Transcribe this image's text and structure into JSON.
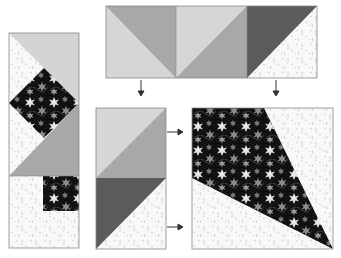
{
  "diagram": {
    "colors": {
      "light_gray": "#d4d4d4",
      "medium_gray": "#a6a6a6",
      "dark_gray": "#5b5b5b",
      "background_print": "#f7f7f7",
      "floral_base": "#111111",
      "floral_star": "#8a8a8a",
      "floral_highlight": "#e8e8e8",
      "outline": "#7a7a7a"
    },
    "panels": [
      {
        "id": "assembled-strip",
        "description": "Tall assembled unit: light and medium triangles around floral diamond, with floral square on speckled background"
      },
      {
        "id": "half-square-triangles-row",
        "description": "Three half-square triangle units: light/medium, light/medium, dark/background"
      },
      {
        "id": "hst-stack",
        "description": "Two stacked half-square triangle units: light/medium over dark/background"
      },
      {
        "id": "floral-kite-block",
        "description": "Square block with floral kite wedge on speckled background"
      }
    ],
    "arrows": [
      {
        "direction": "down",
        "from": "half-square-triangles-row",
        "to": "hst-stack"
      },
      {
        "direction": "down",
        "from": "half-square-triangles-row",
        "to": "floral-kite-block"
      },
      {
        "direction": "right",
        "from": "hst-stack",
        "to": "floral-kite-block"
      },
      {
        "direction": "right",
        "from": "hst-stack",
        "to": "floral-kite-block"
      }
    ]
  }
}
